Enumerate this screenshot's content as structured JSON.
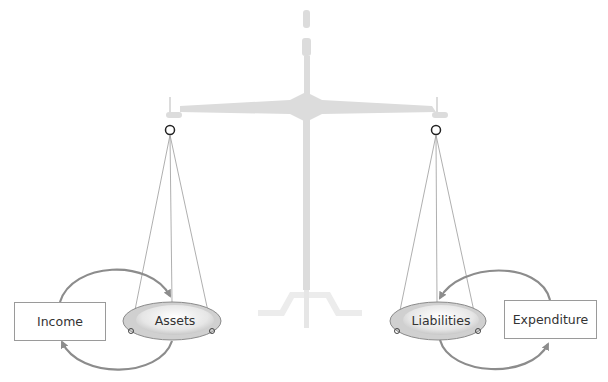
{
  "diagram": {
    "title": "",
    "nodes": {
      "income": "Income",
      "assets": "Assets",
      "liabilities": "Liabilities",
      "expenditure": "Expenditure"
    },
    "edges": [
      {
        "from": "income",
        "to": "assets"
      },
      {
        "from": "assets",
        "to": "income"
      },
      {
        "from": "expenditure",
        "to": "liabilities"
      },
      {
        "from": "liabilities",
        "to": "expenditure"
      }
    ],
    "metaphor": "balance-scale",
    "colors": {
      "scale": "#dcdcdc",
      "scale_base": "#ececec",
      "arrow": "#8c8c8c",
      "pan_rim": "#a0a0a0",
      "box_border": "#9a9a9a",
      "text": "#333333"
    }
  }
}
